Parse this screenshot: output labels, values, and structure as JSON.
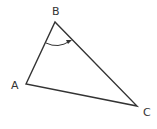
{
  "diagram": {
    "type": "triangle",
    "vertices": {
      "A": {
        "label": "A",
        "x": 26,
        "y": 84
      },
      "B": {
        "label": "B",
        "x": 55,
        "y": 22
      },
      "C": {
        "label": "C",
        "x": 137,
        "y": 106
      }
    },
    "angle_marker": {
      "at": "B",
      "style": "arc-with-arrow",
      "direction": "from BA to BC"
    },
    "colors": {
      "stroke": "#333333",
      "background": "#ffffff"
    }
  }
}
